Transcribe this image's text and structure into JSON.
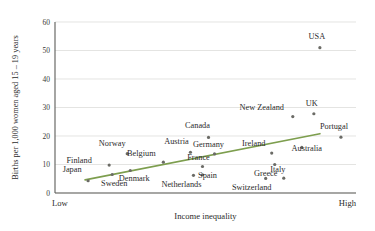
{
  "chart_data": {
    "type": "scatter",
    "title": "",
    "xlabel": "Income inequality",
    "ylabel": "Births per 1,000 women aged 15 – 19 years",
    "ylim": [
      0,
      60
    ],
    "yticks": [
      0,
      10,
      20,
      30,
      40,
      50,
      60
    ],
    "ytick_labels": [
      "0",
      "10",
      "20",
      "30",
      "40",
      "50",
      "60"
    ],
    "xlim": [
      0,
      100
    ],
    "x_axis_endpoints": [
      "Low",
      "High"
    ],
    "grid": "horizontal",
    "legend": "none",
    "marker_color": "#6b6b66",
    "trendline_color": "#7d9e4e",
    "trendline": {
      "x_start": 10,
      "y_start": 4.6,
      "x_end": 88,
      "y_end": 20.8
    },
    "points": [
      {
        "label": "Japan",
        "x": 11,
        "y": 4.3,
        "label_dx": -16,
        "label_dy": -9
      },
      {
        "label": "Sweden",
        "x": 19,
        "y": 6.5,
        "label_dx": 2,
        "label_dy": 12
      },
      {
        "label": "Finland",
        "x": 18,
        "y": 9.8,
        "label_dx": -30,
        "label_dy": -2
      },
      {
        "label": "Norway",
        "x": 24,
        "y": 13.8,
        "label_dx": -15,
        "label_dy": -8
      },
      {
        "label": "Denmark",
        "x": 25,
        "y": 7.9,
        "label_dx": 4,
        "label_dy": 11
      },
      {
        "label": "Belgium",
        "x": 36,
        "y": 10.8,
        "label_dx": -22,
        "label_dy": -6
      },
      {
        "label": "Austria",
        "x": 45,
        "y": 14.3,
        "label_dx": -14,
        "label_dy": -8
      },
      {
        "label": "Germany",
        "x": 53,
        "y": 13.7,
        "label_dx": -6,
        "label_dy": -7
      },
      {
        "label": "Canada",
        "x": 51,
        "y": 19.5,
        "label_dx": -11,
        "label_dy": -9
      },
      {
        "label": "France",
        "x": 49,
        "y": 9.3,
        "label_dx": -4,
        "label_dy": -6
      },
      {
        "label": "Netherlands",
        "x": 46,
        "y": 6.2,
        "label_dx": -12,
        "label_dy": 12
      },
      {
        "label": "Spain",
        "x": 49,
        "y": 6.4,
        "label_dx": 5,
        "label_dy": 3
      },
      {
        "label": "Switzerland",
        "x": 70,
        "y": 5.1,
        "label_dx": -14,
        "label_dy": 12
      },
      {
        "label": "Italy",
        "x": 76,
        "y": 5.2,
        "label_dx": -6,
        "label_dy": -6
      },
      {
        "label": "Greece",
        "x": 73,
        "y": 10.0,
        "label_dx": -9,
        "label_dy": 11
      },
      {
        "label": "Ireland",
        "x": 72,
        "y": 14.0,
        "label_dx": -18,
        "label_dy": -7
      },
      {
        "label": "Australia",
        "x": 82,
        "y": 16.0,
        "label_dx": 5,
        "label_dy": 4
      },
      {
        "label": "New Zealand",
        "x": 79,
        "y": 26.8,
        "label_dx": -31,
        "label_dy": -7
      },
      {
        "label": "UK",
        "x": 86,
        "y": 27.8,
        "label_dx": -2,
        "label_dy": -8
      },
      {
        "label": "Portugal",
        "x": 95,
        "y": 19.6,
        "label_dx": -7,
        "label_dy": -8
      },
      {
        "label": "USA",
        "x": 88,
        "y": 51.0,
        "label_dx": -3,
        "label_dy": -9
      }
    ]
  }
}
